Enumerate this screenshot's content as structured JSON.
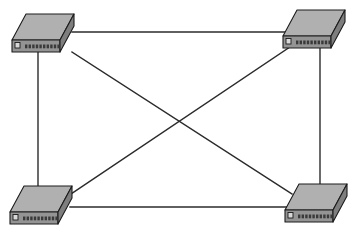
{
  "diagram": {
    "width": 361,
    "height": 240,
    "background_color": "#ffffff",
    "topology": "full-mesh",
    "node_count": 4,
    "link_count": 6
  },
  "colors": {
    "line": "#2b2b2b",
    "device_top": "#b0b0b0",
    "device_front": "#949494",
    "device_end": "#7e7e7e",
    "device_outline": "#1c1c1c",
    "port": "#3a3a3a",
    "led": "#d8d8d8"
  },
  "nodes": [
    {
      "id": "switch-top-left",
      "label": "",
      "icon": "network-switch-icon",
      "position": "top-left",
      "x": 12,
      "y": 14,
      "port_count": 10
    },
    {
      "id": "switch-top-right",
      "label": "",
      "icon": "network-switch-icon",
      "position": "top-right",
      "x": 283,
      "y": 10,
      "port_count": 10
    },
    {
      "id": "switch-bottom-left",
      "label": "",
      "icon": "network-switch-icon",
      "position": "bottom-left",
      "x": 10,
      "y": 186,
      "port_count": 10
    },
    {
      "id": "switch-bottom-right",
      "label": "",
      "icon": "network-switch-icon",
      "position": "bottom-right",
      "x": 285,
      "y": 184,
      "port_count": 10
    }
  ],
  "links": [
    {
      "id": "link-top",
      "from": "switch-top-left",
      "to": "switch-top-right",
      "kind": "horizontal",
      "x1": 72,
      "y1": 32,
      "x2": 293,
      "y2": 32
    },
    {
      "id": "link-bottom",
      "from": "switch-bottom-left",
      "to": "switch-bottom-right",
      "kind": "horizontal",
      "x1": 70,
      "y1": 207,
      "x2": 292,
      "y2": 207
    },
    {
      "id": "link-left",
      "from": "switch-top-left",
      "to": "switch-bottom-left",
      "kind": "vertical",
      "x1": 38,
      "y1": 47,
      "x2": 38,
      "y2": 199
    },
    {
      "id": "link-right",
      "from": "switch-top-right",
      "to": "switch-bottom-right",
      "kind": "vertical",
      "x1": 320,
      "y1": 45,
      "x2": 320,
      "y2": 196
    },
    {
      "id": "link-diagonal-nw-se",
      "from": "switch-top-left",
      "to": "switch-bottom-right",
      "kind": "diagonal",
      "x1": 72,
      "y1": 52,
      "x2": 292,
      "y2": 194
    },
    {
      "id": "link-diagonal-ne-sw",
      "from": "switch-top-right",
      "to": "switch-bottom-left",
      "kind": "diagonal",
      "x1": 290,
      "y1": 47,
      "x2": 68,
      "y2": 196
    }
  ],
  "crossing_point": {
    "x": 178,
    "y": 122
  }
}
